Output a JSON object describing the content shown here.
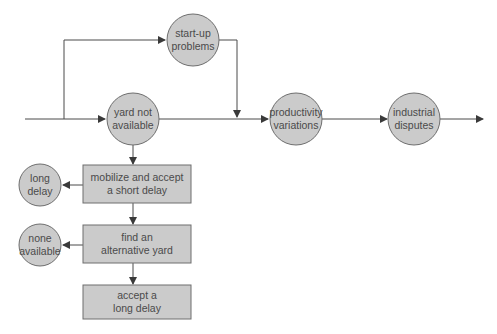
{
  "colors": {
    "node_fill": "#cbcbcb",
    "node_stroke": "#6e6e6e",
    "line": "#4a4a4a",
    "text": "#4a4a4a"
  },
  "nodes": {
    "startup": {
      "line1": "start-up",
      "line2": "problems"
    },
    "yard": {
      "line1": "yard not",
      "line2": "available"
    },
    "productivity": {
      "line1": "productivity",
      "line2": "variations"
    },
    "industrial": {
      "line1": "industrial",
      "line2": "disputes"
    },
    "long_delay": {
      "line1": "long",
      "line2": "delay"
    },
    "none_available": {
      "line1": "none",
      "line2": "available"
    }
  },
  "boxes": {
    "mobilize": {
      "line1": "mobilize and accept",
      "line2": "a short delay"
    },
    "find_yard": {
      "line1": "find an",
      "line2": "alternative yard"
    },
    "accept_long": {
      "line1": "accept a",
      "line2": "long delay"
    }
  }
}
